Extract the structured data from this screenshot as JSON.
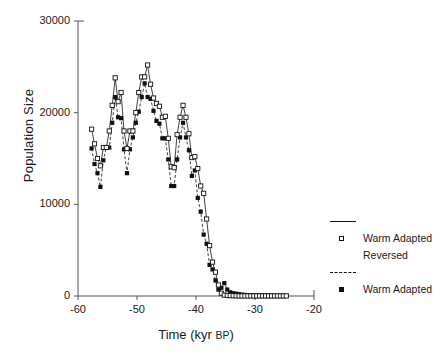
{
  "chart_data": {
    "type": "line",
    "title": "",
    "xlabel": "Time (kyr BP)",
    "xlabel_main": "Time (kyr ",
    "xlabel_smallcaps": "BP",
    "xlabel_tail": ")",
    "ylabel": "Population Size",
    "xlim": [
      -60,
      -20
    ],
    "ylim": [
      0,
      30000
    ],
    "xticks": [
      -60,
      -50,
      -40,
      -30,
      -20
    ],
    "xtick_labels": [
      "-60",
      "-50",
      "-40",
      "-30",
      "-20"
    ],
    "yticks": [
      0,
      10000,
      20000,
      30000
    ],
    "ytick_labels": [
      "0",
      "10000",
      "20000",
      "30000"
    ],
    "grid": false,
    "legend_position": "right",
    "series": [
      {
        "name": "Warm Adapted Reversed",
        "marker": "open-square",
        "linestyle": "solid",
        "color": "#111111",
        "x": [
          -57.7,
          -57.2,
          -56.7,
          -56.2,
          -55.7,
          -55.2,
          -54.7,
          -54.2,
          -53.7,
          -53.2,
          -52.7,
          -52.2,
          -51.7,
          -51.2,
          -50.7,
          -50.2,
          -49.7,
          -49.2,
          -48.7,
          -48.2,
          -47.7,
          -47.2,
          -46.7,
          -46.2,
          -45.7,
          -45.2,
          -44.7,
          -44.2,
          -43.7,
          -43.2,
          -42.7,
          -42.2,
          -41.7,
          -41.2,
          -40.7,
          -40.2,
          -39.7,
          -39.2,
          -38.7,
          -38.2,
          -37.7,
          -37.2,
          -36.7,
          -36.2,
          -35.7,
          -35.2,
          -34.7,
          -34.2,
          -33.7,
          -33.2,
          -32.7,
          -32.2,
          -31.7,
          -31.2,
          -30.7,
          -30.2,
          -29.7,
          -29.2,
          -28.7,
          -28.2,
          -27.7,
          -27.2,
          -26.7,
          -26.2,
          -25.7,
          -25.2,
          -24.7
        ],
        "y": [
          18200,
          16600,
          15000,
          14200,
          16200,
          16200,
          18000,
          20800,
          23800,
          21200,
          22200,
          18000,
          16100,
          18000,
          18000,
          20000,
          22200,
          23900,
          23900,
          25200,
          23100,
          21600,
          21000,
          20700,
          19500,
          19600,
          17200,
          14100,
          14000,
          17600,
          19500,
          20800,
          19500,
          17700,
          15100,
          15200,
          13900,
          12000,
          11200,
          8400,
          5500,
          3700,
          2600,
          1200,
          300,
          100,
          60,
          40,
          30,
          20,
          10,
          10,
          10,
          10,
          10,
          10,
          10,
          10,
          10,
          10,
          10,
          10,
          10,
          10,
          10,
          10,
          10
        ]
      },
      {
        "name": "Warm Adapted",
        "marker": "filled-square",
        "linestyle": "dashed",
        "color": "#111111",
        "x": [
          -57.7,
          -57.2,
          -56.7,
          -56.2,
          -55.7,
          -55.2,
          -54.7,
          -54.2,
          -53.7,
          -53.2,
          -52.7,
          -52.2,
          -51.7,
          -51.2,
          -50.7,
          -50.2,
          -49.7,
          -49.2,
          -48.7,
          -48.2,
          -47.7,
          -47.2,
          -46.7,
          -46.2,
          -45.7,
          -45.2,
          -44.7,
          -44.2,
          -43.7,
          -43.2,
          -42.7,
          -42.2,
          -41.7,
          -41.2,
          -40.7,
          -40.2,
          -39.7,
          -39.2,
          -38.7,
          -38.2,
          -37.7,
          -37.2,
          -36.7,
          -36.2,
          -35.7,
          -35.2,
          -34.7,
          -34.2,
          -33.7,
          -33.2,
          -32.7,
          -32.2,
          -31.7,
          -31.2,
          -30.7,
          -30.2,
          -29.7,
          -29.2,
          -28.7,
          -28.2,
          -27.7,
          -27.2,
          -26.7,
          -26.2,
          -25.7,
          -25.2,
          -24.7
        ],
        "y": [
          16100,
          14400,
          13400,
          11900,
          14800,
          16200,
          16200,
          18900,
          21700,
          19500,
          19400,
          16000,
          13400,
          16000,
          17300,
          18900,
          20100,
          21700,
          23200,
          21700,
          21500,
          20200,
          19100,
          18800,
          17200,
          17200,
          14900,
          12000,
          12000,
          14900,
          17300,
          18900,
          17300,
          15900,
          13100,
          13700,
          10700,
          9200,
          6700,
          5700,
          3400,
          2900,
          1700,
          700,
          900,
          1400,
          700,
          400,
          300,
          250,
          200,
          150,
          120,
          100,
          90,
          80,
          70,
          60,
          50,
          40,
          35,
          30,
          25,
          20,
          15,
          12,
          10
        ]
      }
    ]
  },
  "legend": {
    "entries": [
      {
        "label_line1": "Warm Adapted",
        "label_line2": "Reversed",
        "marker": "open-square",
        "linestyle": "solid"
      },
      {
        "label_line1": "Warm Adapted",
        "label_line2": "",
        "marker": "filled-square",
        "linestyle": "dashed"
      }
    ],
    "entry1_label_line1": "Warm Adapted",
    "entry1_label_line2": "Reversed",
    "entry2_label_line1": "Warm Adapted"
  }
}
